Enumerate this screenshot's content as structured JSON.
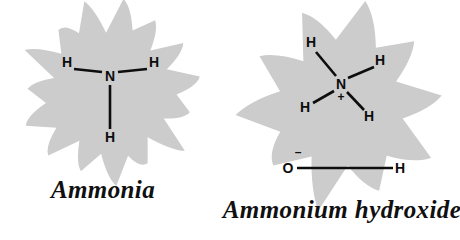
{
  "canvas": {
    "width": 460,
    "height": 240,
    "background_color": "#ffffff"
  },
  "style": {
    "burst_fill_color": "#cccccc",
    "bond_color": "#0d0d0d",
    "label_color": "#0d0d0d",
    "caption_color": "#101010"
  },
  "figures": [
    {
      "id": "ammonia",
      "caption": "Ammonia",
      "formula": "NH3",
      "burst": {
        "shape": "starburst",
        "points": 15,
        "center_x": 110,
        "center_y": 92,
        "outer_radius": 88,
        "inner_radius": 62
      },
      "atoms": [
        {
          "name": "nitrogen-center",
          "label": "N",
          "x": 110,
          "y": 76
        },
        {
          "name": "hydrogen-upper-left",
          "label": "H",
          "x": 67,
          "y": 62
        },
        {
          "name": "hydrogen-upper-right",
          "label": "H",
          "x": 154,
          "y": 62
        },
        {
          "name": "hydrogen-bottom",
          "label": "H",
          "x": 110,
          "y": 137
        }
      ],
      "bonds": [
        {
          "name": "bond-n-h-upper-left",
          "x1": 74,
          "y1": 69,
          "x2": 102,
          "y2": 72
        },
        {
          "name": "bond-n-h-upper-right",
          "x1": 118,
          "y1": 72,
          "x2": 147,
          "y2": 69
        },
        {
          "name": "bond-n-h-bottom",
          "x1": 110,
          "y1": 85,
          "x2": 110,
          "y2": 129
        }
      ],
      "charges": []
    },
    {
      "id": "ammonium-hydroxide",
      "caption": "Ammonium hydroxide",
      "formula": "NH4OH",
      "burst": {
        "shape": "starburst",
        "points": 10,
        "center_x": 342,
        "center_y": 105,
        "outer_radius": 100,
        "inner_radius": 63
      },
      "atoms": [
        {
          "name": "nitrogen-center",
          "label": "N",
          "x": 341,
          "y": 84
        },
        {
          "name": "hydrogen-top",
          "label": "H",
          "x": 311,
          "y": 42
        },
        {
          "name": "hydrogen-right",
          "label": "H",
          "x": 380,
          "y": 60
        },
        {
          "name": "hydrogen-lower-left",
          "label": "H",
          "x": 305,
          "y": 107
        },
        {
          "name": "hydrogen-lower-right",
          "label": "H",
          "x": 369,
          "y": 116
        },
        {
          "name": "oxygen-hydroxide",
          "label": "O",
          "x": 288,
          "y": 168
        },
        {
          "name": "hydrogen-hydroxide",
          "label": "H",
          "x": 400,
          "y": 168
        }
      ],
      "bonds": [
        {
          "name": "bond-n-h-top",
          "x1": 316,
          "y1": 52,
          "x2": 336,
          "y2": 76
        },
        {
          "name": "bond-n-h-right",
          "x1": 348,
          "y1": 78,
          "x2": 374,
          "y2": 67
        },
        {
          "name": "bond-n-h-lower-left",
          "x1": 313,
          "y1": 103,
          "x2": 334,
          "y2": 91
        },
        {
          "name": "bond-n-h-lower-right",
          "x1": 347,
          "y1": 92,
          "x2": 364,
          "y2": 110
        },
        {
          "name": "bond-o-h-hydroxide",
          "x1": 297,
          "y1": 168,
          "x2": 393,
          "y2": 168
        }
      ],
      "charges": [
        {
          "name": "positive-charge-nitrogen",
          "label": "+",
          "x": 341,
          "y": 97
        },
        {
          "name": "negative-charge-oxygen",
          "label": "–",
          "x": 298,
          "y": 152
        }
      ]
    }
  ]
}
